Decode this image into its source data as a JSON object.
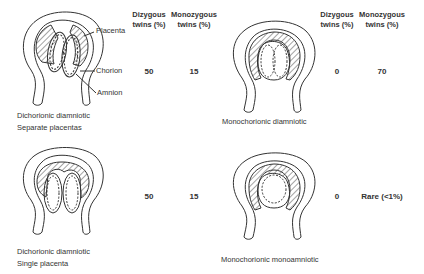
{
  "columns": {
    "left": {
      "dizygous": "Dizygous\ntwins (%)",
      "monozygous": "Monozygous\ntwins (%)"
    },
    "right": {
      "dizygous": "Dizygous\ntwins (%)",
      "monozygous": "Monozygous\ntwins (%)"
    }
  },
  "labels": {
    "placenta": "Placenta",
    "chorion": "Chorion",
    "amnion": "Amnion"
  },
  "panels": [
    {
      "caption_line1": "Dichorionic diamniotic",
      "caption_line2": "Separate placentas",
      "dizygous": "50",
      "monozygous": "15"
    },
    {
      "caption_line1": "Monochorionic diamniotic",
      "caption_line2": "",
      "dizygous": "0",
      "monozygous": "70"
    },
    {
      "caption_line1": "Dichorionic diamniotic",
      "caption_line2": "Single placenta",
      "dizygous": "50",
      "monozygous": "15"
    },
    {
      "caption_line1": "Monochorionic monoamniotic",
      "caption_line2": "",
      "dizygous": "0",
      "monozygous": "Rare (<1%)"
    }
  ],
  "colors": {
    "line": "#333333",
    "background": "#ffffff"
  }
}
